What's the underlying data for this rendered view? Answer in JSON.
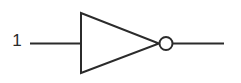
{
  "diagram": {
    "type": "logic-gate-schematic",
    "canvas": {
      "width": 241,
      "height": 83,
      "background": "#ffffff"
    },
    "style": {
      "stroke_color": "#2b2b2b",
      "stroke_width": 2,
      "bubble_fill": "#ffffff"
    },
    "labels": {
      "input_pin": "1"
    },
    "geometry": {
      "input_wire": {
        "x1": 30,
        "y1": 43.5,
        "x2": 81,
        "y2": 43.5
      },
      "gate_triangle": {
        "points": "81,13 81,73 159,43.5"
      },
      "inversion_bubble": {
        "cx": 166,
        "cy": 43.5,
        "r": 6.5
      },
      "output_wire": {
        "x1": 173,
        "y1": 43.5,
        "x2": 224,
        "y2": 43.5
      }
    }
  }
}
